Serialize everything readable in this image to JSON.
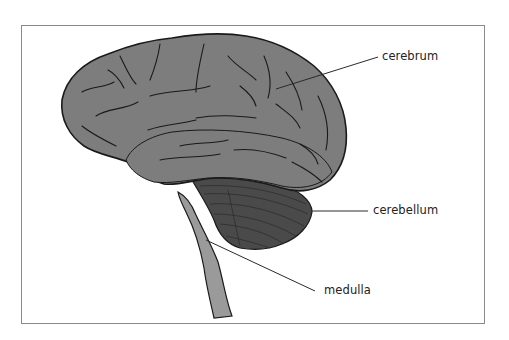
{
  "diagram": {
    "colors": {
      "cerebrum": "#7d7d7d",
      "cerebellum": "#4a4a4a",
      "brainstem": "#9a9a9a",
      "outline": "#1a1a1a",
      "leader_line": "#2a2a2a",
      "frame": "#8a8a8a"
    },
    "labels": [
      {
        "id": "cerebrum",
        "text": "cerebrum"
      },
      {
        "id": "cerebellum",
        "text": "cerebellum"
      },
      {
        "id": "medulla",
        "text": "medulla"
      }
    ]
  }
}
